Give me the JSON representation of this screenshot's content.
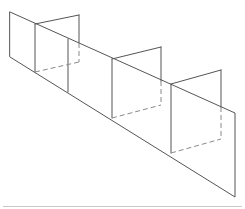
{
  "figure": {
    "type": "line-drawing",
    "colors": {
      "line": "#555555",
      "hidden_line": "#8a8a8a",
      "rule": "#c8c8c8",
      "background": "#ffffff"
    }
  },
  "wall": {
    "outline": [
      [
        10,
        12
      ],
      [
        235,
        113
      ],
      [
        235,
        197
      ],
      [
        10,
        57
      ]
    ]
  },
  "dividers": [
    {
      "from": [
        68,
        39
      ],
      "to": [
        68,
        92
      ]
    }
  ],
  "fins": [
    {
      "front_top": [
        35,
        24
      ],
      "front_bottom": [
        35,
        72
      ],
      "back_top": [
        79,
        15
      ],
      "back_wall_cross": [
        79,
        43
      ],
      "back_bottom": [
        79,
        62
      ]
    },
    {
      "front_top": [
        112,
        59
      ],
      "front_bottom": [
        112,
        118
      ],
      "back_top": [
        161,
        47
      ],
      "back_wall_cross": [
        161,
        81
      ],
      "back_bottom": [
        161,
        105
      ]
    },
    {
      "front_top": [
        171,
        84
      ],
      "front_bottom": [
        171,
        153
      ],
      "back_top": [
        221,
        70
      ],
      "back_wall_cross": [
        221,
        107
      ],
      "back_bottom": [
        221,
        139
      ]
    }
  ],
  "rule": {
    "y": 206,
    "x_start": 3,
    "x_end": 242
  }
}
